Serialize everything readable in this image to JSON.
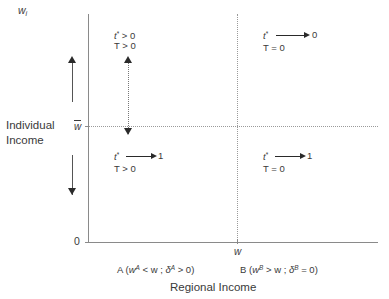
{
  "figure": {
    "type": "diagram",
    "y_axis": {
      "top_symbol": "w",
      "top_symbol_sub": "i",
      "title_line1": "Individual",
      "title_line2": "Income",
      "tick_wbar": "w",
      "origin": "0"
    },
    "x_axis": {
      "title": "Regional Income",
      "tick_w": "w"
    },
    "quadrants": {
      "top_left": {
        "line1_var": "t",
        "line1_star": "*",
        "line1_rel": "> 0",
        "line2": "T > 0"
      },
      "top_right": {
        "line1_var": "t",
        "line1_star": "*",
        "line1_target": "0",
        "line2": "T = 0"
      },
      "bottom_left": {
        "line1_var": "t",
        "line1_star": "*",
        "line1_target": "1",
        "line2": "T > 0"
      },
      "bottom_right": {
        "line1_var": "t",
        "line1_star": "*",
        "line1_target": "1",
        "line2": "T = 0"
      }
    },
    "region_labels": {
      "a": {
        "name": "A",
        "open": "(",
        "w_var": "w",
        "w_sup": "A",
        "rel1": "< w ;",
        "delta": "δ",
        "delta_sup": "A",
        "rel2": "> 0",
        "close": ")"
      },
      "b": {
        "name": "B",
        "open": "(",
        "w_var": "w",
        "w_sup": "B",
        "rel1": "> w ;",
        "delta": "δ",
        "delta_sup": "B",
        "rel2": "= 0",
        "close": ")"
      }
    },
    "colors": {
      "axis": "#8a8a8a",
      "dotted": "#9a9a9a",
      "arrow": "#2a2a2a",
      "text": "#3a3a3a",
      "background": "#ffffff"
    }
  }
}
